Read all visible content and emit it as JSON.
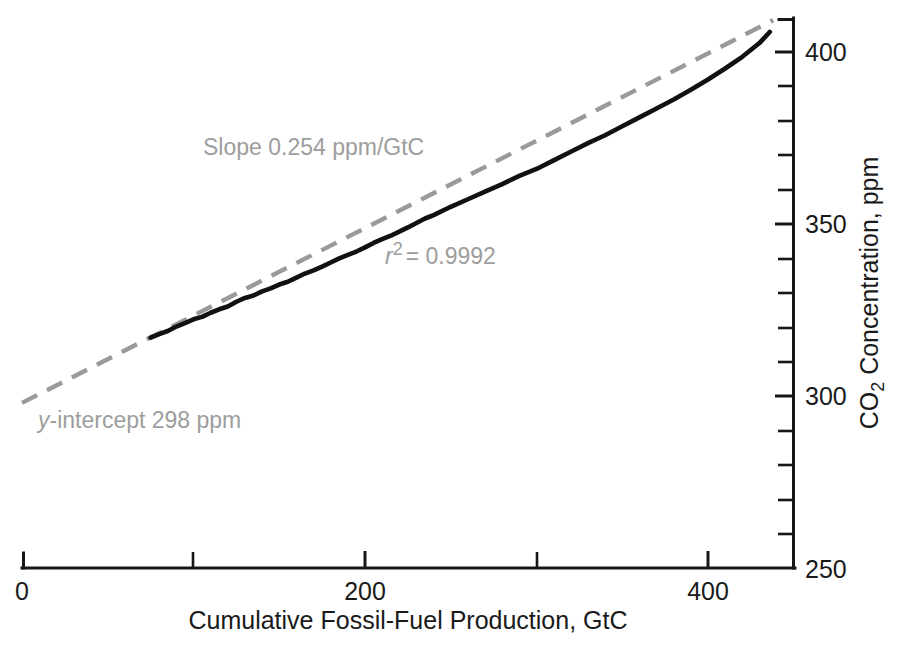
{
  "chart_data": {
    "type": "line",
    "title": "",
    "xlabel": "Cumulative Fossil-Fuel Production, GtC",
    "ylabel": "CO2 Concentration, ppm",
    "ylabel_parts": {
      "pre": "CO",
      "sub": "2",
      "post": " Concentration, ppm"
    },
    "xlim": [
      0,
      450
    ],
    "ylim": [
      250,
      406
    ],
    "xticks_major": [
      0,
      200,
      400
    ],
    "xticks_major_labels": [
      "0",
      "200",
      "400"
    ],
    "xticks_minor": [
      100,
      300
    ],
    "yticks_major": [
      250,
      300,
      350,
      400
    ],
    "yticks_major_labels": [
      "250",
      "300",
      "350",
      "400"
    ],
    "yticks_minor": [
      260,
      270,
      280,
      290,
      310,
      320,
      330,
      340,
      360,
      370,
      380,
      390
    ],
    "grid": false,
    "legend": "none",
    "y_axis_position": "right",
    "series": [
      {
        "name": "Observed CO2 vs cumulative fossil-fuel production",
        "style": "solid-black",
        "color": "#111111",
        "x": [
          75,
          80,
          85,
          90,
          95,
          100,
          105,
          110,
          115,
          120,
          125,
          130,
          135,
          140,
          145,
          150,
          155,
          160,
          165,
          170,
          175,
          180,
          185,
          190,
          195,
          200,
          205,
          210,
          215,
          220,
          225,
          230,
          235,
          240,
          250,
          260,
          270,
          280,
          290,
          300,
          310,
          320,
          330,
          340,
          350,
          360,
          370,
          380,
          390,
          400,
          410,
          420,
          430,
          436
        ],
        "y": [
          317.0,
          318.0,
          318.9,
          320.2,
          321.2,
          322.3,
          323.0,
          324.2,
          325.2,
          326.0,
          327.4,
          328.5,
          329.2,
          330.4,
          331.3,
          332.4,
          333.2,
          334.4,
          335.6,
          336.5,
          337.6,
          338.8,
          340.0,
          341.0,
          342.0,
          343.2,
          344.5,
          345.6,
          346.6,
          347.8,
          349.0,
          350.3,
          351.6,
          352.6,
          355.0,
          357.2,
          359.4,
          361.6,
          364.0,
          366.0,
          368.5,
          371.0,
          373.5,
          375.8,
          378.4,
          381.0,
          383.6,
          386.2,
          389.0,
          392.0,
          395.2,
          398.6,
          402.6,
          405.8
        ]
      },
      {
        "name": "Linear fit",
        "style": "dashed-gray",
        "color": "#9a9a9a",
        "slope": 0.254,
        "intercept": 298,
        "x_range": [
          0,
          438
        ]
      }
    ],
    "annotations": [
      {
        "id": "slope",
        "text": "Slope 0.254 ppm/GtC",
        "x_px": 203,
        "y_px": 155,
        "color": "#9d9d9d"
      },
      {
        "id": "r-squared",
        "text": "r2 = 0.9992",
        "prefix_italic": "r",
        "superscript": "2",
        "suffix": "= 0.9992",
        "x_px": 385,
        "y_px": 264,
        "color": "#9d9d9d"
      },
      {
        "id": "y-intercept",
        "text": "y-intercept 298 ppm",
        "prefix_italic": "y",
        "suffix": "-intercept 298 ppm",
        "x_px": 38,
        "y_px": 428,
        "color": "#9d9d9d"
      }
    ]
  },
  "axes": {
    "x_axis_name": "cumulative-fossil-fuel-production-axis",
    "y_axis_name": "co2-concentration-axis"
  }
}
